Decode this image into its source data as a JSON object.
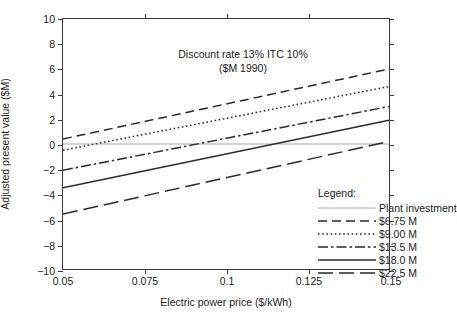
{
  "chart_data": {
    "type": "line",
    "title": "",
    "xlabel": "Electric power price ($/kWh)",
    "ylabel": "Adjusted present value ($M)",
    "xlim": [
      0.05,
      0.15
    ],
    "ylim": [
      -10,
      10
    ],
    "xticks": [
      "0.05",
      "0.075",
      "0.1",
      "0.125",
      "0.15"
    ],
    "xtick_values": [
      0.05,
      0.075,
      0.1,
      0.125,
      0.15
    ],
    "yticks": [
      "10",
      "8",
      "6",
      "4",
      "2",
      "0",
      "−2",
      "−4",
      "−6",
      "−8",
      "−10"
    ],
    "ytick_values": [
      10,
      8,
      6,
      4,
      2,
      0,
      -2,
      -4,
      -6,
      -8,
      -10
    ],
    "grid": false,
    "legend_position": "inside-lower-right",
    "annotations": [
      "Discount rate 13% ITC 10%",
      "($M 1990)"
    ],
    "legend_title": "Legend:",
    "x": [
      0.05,
      0.15
    ],
    "series": [
      {
        "name": "Plant investment",
        "style": "solid-light",
        "color": "#a8a8a8",
        "values": [
          0.0,
          0.0
        ]
      },
      {
        "name": "$6.75 M",
        "style": "dashed",
        "color": "#2a2a2a",
        "values": [
          0.4,
          6.0
        ]
      },
      {
        "name": "$9.00 M",
        "style": "dotted",
        "color": "#2a2a2a",
        "values": [
          -0.5,
          4.6
        ]
      },
      {
        "name": "$13.5 M",
        "style": "dash-dot",
        "color": "#2a2a2a",
        "values": [
          -2.1,
          3.0
        ]
      },
      {
        "name": "$18.0 M",
        "style": "solid",
        "color": "#2a2a2a",
        "values": [
          -3.5,
          1.9
        ]
      },
      {
        "name": "$22.5 M",
        "style": "long-dashed",
        "color": "#2a2a2a",
        "values": [
          -5.6,
          0.2
        ]
      }
    ]
  }
}
